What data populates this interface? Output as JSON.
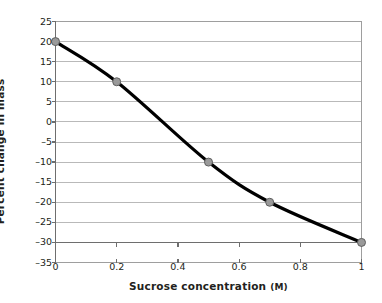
{
  "chart_data": {
    "type": "line",
    "title": "",
    "xlabel": "Sucrose concentration",
    "xlabel_unit": "(M)",
    "xlabel_full": "Sucrose concentration (M)",
    "ylabel": "Percent change in mass",
    "xlim": [
      0,
      1
    ],
    "ylim": [
      -35,
      25
    ],
    "xticks": [
      0,
      0.2,
      0.4,
      0.6,
      0.8,
      1
    ],
    "xtick_labels": [
      "0",
      "0.2",
      "0.4",
      "0.6",
      "0.8",
      "1"
    ],
    "yticks": [
      25,
      20,
      15,
      10,
      5,
      0,
      -5,
      -10,
      -15,
      -20,
      -25,
      -30,
      -35
    ],
    "ytick_labels": [
      "25",
      "20",
      "15",
      "10",
      "5",
      "0",
      "-5",
      "-10",
      "-15",
      "-20",
      "-25",
      "-30",
      "-35"
    ],
    "grid": true,
    "grid_axis": "y",
    "legend": "none",
    "series": [
      {
        "name": "Percent change in mass",
        "x": [
          0,
          0.2,
          0.5,
          0.7,
          1.0
        ],
        "values": [
          20,
          10,
          -10,
          -20,
          -30
        ],
        "line_color": "#000000",
        "marker_color": "#9a9a9a",
        "marker_edge_color": "#5f5f5f",
        "marker": "circle",
        "smooth": true
      }
    ],
    "colors": {
      "line": "#000000",
      "marker_fill": "#9a9a9a",
      "marker_edge": "#5f5f5f",
      "gridline": "#b9b9b9",
      "axis": "#6e6e6e",
      "frame": "#9e9e9e",
      "text": "#231f20",
      "background": "#ffffff"
    }
  }
}
